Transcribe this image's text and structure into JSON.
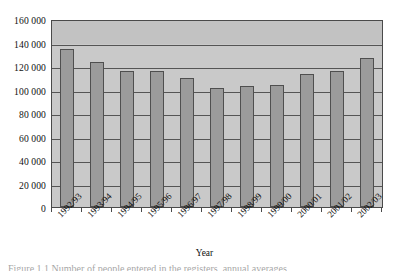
{
  "chart_data": {
    "type": "bar",
    "title": "",
    "xlabel": "Year",
    "ylabel": "",
    "ylim": [
      0,
      160000
    ],
    "ytick_step": 20000,
    "grid": true,
    "legend": "none",
    "categories": [
      "1992/93",
      "1993/94",
      "1994/95",
      "1995/96",
      "1996/97",
      "1997/98",
      "1998/99",
      "1999/00",
      "2000/01",
      "2001/02",
      "2002/03"
    ],
    "values": [
      136000,
      125000,
      117000,
      117000,
      111000,
      102000,
      104000,
      105000,
      114000,
      117000,
      128000
    ],
    "ytick_labels": [
      "0",
      "20 000",
      "40 000",
      "60 000",
      "80 000",
      "100 000",
      "120 000",
      "140 000",
      "160 000"
    ],
    "ytick_values": [
      0,
      20000,
      40000,
      60000,
      80000,
      100000,
      120000,
      140000,
      160000
    ],
    "colors": {
      "bar_fill": "#9b9b9b",
      "bar_border": "#4f4f4f",
      "plot_background": "#c9c9c9",
      "plot_band": "#c2c2c2",
      "gridline": "#555555",
      "axis": "#4a4a4a",
      "text": "#111111"
    }
  },
  "caption": {
    "text": "Figure 1.1  Number of people entered in the registers, annual averages"
  }
}
